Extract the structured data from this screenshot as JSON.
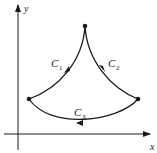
{
  "diagram": {
    "type": "closed-curve-on-axes",
    "colors": {
      "ink": "#1a1a1a",
      "background": "#ffffff"
    },
    "axes": {
      "x_label": "x",
      "y_label": "y"
    },
    "points": [
      {
        "name": "top",
        "x": 85,
        "y": 26
      },
      {
        "name": "left",
        "x": 29,
        "y": 99
      },
      {
        "name": "right",
        "x": 138,
        "y": 99
      }
    ],
    "curves": [
      {
        "name": "C1",
        "base": "C",
        "subscript": "1",
        "from": "top",
        "to": "left",
        "direction": "down-left"
      },
      {
        "name": "C2",
        "base": "C",
        "subscript": "2",
        "from": "top",
        "to": "right",
        "direction": "down-right"
      },
      {
        "name": "C3",
        "base": "C",
        "subscript": "3",
        "from": "right",
        "to": "left",
        "direction": "leftward"
      }
    ]
  }
}
